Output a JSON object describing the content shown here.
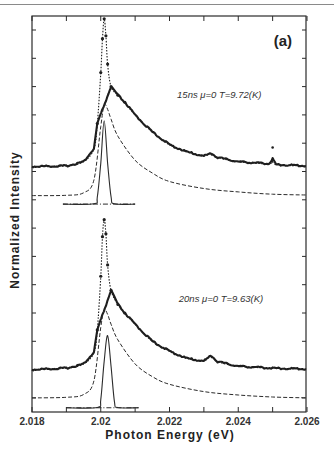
{
  "chart_data": {
    "type": "line",
    "panel_label": "(a)",
    "xlabel": "Photon Energy (eV)",
    "ylabel": "Normalized Intensity",
    "xlim": [
      2.018,
      2.026
    ],
    "x_ticks": [
      2.018,
      2.02,
      2.022,
      2.024,
      2.026
    ],
    "x_tick_labels": [
      "2.018",
      "2.02",
      "2.022",
      "2.024",
      "2.026"
    ],
    "x_minor_ticks": [
      2.019,
      2.021,
      2.023,
      2.025
    ],
    "ylim": [
      0,
      14
    ],
    "y_tick_labels": [],
    "grid": false,
    "legend": null,
    "panels": [
      {
        "annotation": "15ns  μ=0  T=9.72(K)",
        "annotation_pos": [
          2.02222,
          11.1
        ],
        "series": [
          {
            "name": "Measured spectrum (dots)",
            "style": "dotted-markers",
            "baseline": 8.68,
            "points": [
              [
                2.018,
                8.68
              ],
              [
                2.019,
                8.7
              ],
              [
                2.0195,
                8.85
              ],
              [
                2.0198,
                9.3
              ],
              [
                2.0199,
                10.2
              ],
              [
                2.02,
                12.0
              ],
              [
                2.02005,
                13.2
              ],
              [
                2.0201,
                13.9
              ],
              [
                2.02015,
                13.3
              ],
              [
                2.0202,
                12.3
              ],
              [
                2.0203,
                11.5
              ],
              [
                2.0205,
                11.2
              ],
              [
                2.0207,
                10.95
              ],
              [
                2.021,
                10.5
              ],
              [
                2.0215,
                9.9
              ],
              [
                2.022,
                9.45
              ],
              [
                2.0225,
                9.2
              ],
              [
                2.023,
                9.05
              ],
              [
                2.0232,
                9.15
              ],
              [
                2.0234,
                9.0
              ],
              [
                2.024,
                8.85
              ],
              [
                2.0249,
                8.78
              ],
              [
                2.025,
                8.95
              ],
              [
                2.0251,
                8.75
              ],
              [
                2.026,
                8.7
              ]
            ]
          },
          {
            "name": "Fit (dashed)",
            "style": "dashed",
            "baseline": 7.65,
            "points": [
              [
                2.018,
                7.65
              ],
              [
                2.019,
                7.66
              ],
              [
                2.0195,
                7.75
              ],
              [
                2.0198,
                8.2
              ],
              [
                2.02,
                10.1
              ],
              [
                2.0201,
                10.85
              ],
              [
                2.0202,
                10.7
              ],
              [
                2.0203,
                10.35
              ],
              [
                2.0205,
                9.75
              ],
              [
                2.021,
                8.9
              ],
              [
                2.0215,
                8.45
              ],
              [
                2.022,
                8.15
              ],
              [
                2.023,
                7.9
              ],
              [
                2.024,
                7.78
              ],
              [
                2.025,
                7.7
              ],
              [
                2.026,
                7.67
              ]
            ]
          },
          {
            "name": "Instrument response (solid)",
            "style": "solid-with-dashdot-baseline",
            "baseline": 7.35,
            "baseline_range": [
              2.0189,
              2.021
            ],
            "points": [
              [
                2.0189,
                7.35
              ],
              [
                2.0198,
                7.36
              ],
              [
                2.0199,
                7.6
              ],
              [
                2.02,
                8.8
              ],
              [
                2.0201,
                10.3
              ],
              [
                2.0202,
                8.8
              ],
              [
                2.0203,
                7.6
              ],
              [
                2.0204,
                7.36
              ],
              [
                2.021,
                7.35
              ]
            ]
          }
        ]
      },
      {
        "annotation": "20ns  μ=0  T=9.63(K)",
        "annotation_pos": [
          2.02227,
          3.9
        ],
        "series": [
          {
            "name": "Measured spectrum (dots)",
            "style": "dotted-markers",
            "baseline": 1.5,
            "points": [
              [
                2.018,
                1.5
              ],
              [
                2.019,
                1.55
              ],
              [
                2.0195,
                1.7
              ],
              [
                2.0198,
                2.1
              ],
              [
                2.0199,
                2.9
              ],
              [
                2.02,
                4.8
              ],
              [
                2.02005,
                6.2
              ],
              [
                2.0201,
                6.8
              ],
              [
                2.02015,
                6.3
              ],
              [
                2.0202,
                5.2
              ],
              [
                2.0203,
                4.3
              ],
              [
                2.0205,
                3.8
              ],
              [
                2.0207,
                3.5
              ],
              [
                2.021,
                3.1
              ],
              [
                2.0215,
                2.5
              ],
              [
                2.022,
                2.15
              ],
              [
                2.0225,
                1.9
              ],
              [
                2.023,
                1.8
              ],
              [
                2.0232,
                2.0
              ],
              [
                2.0234,
                1.78
              ],
              [
                2.024,
                1.62
              ],
              [
                2.025,
                1.55
              ],
              [
                2.026,
                1.52
              ]
            ]
          },
          {
            "name": "Fit (dashed)",
            "style": "dashed",
            "baseline": 0.5,
            "points": [
              [
                2.018,
                0.5
              ],
              [
                2.019,
                0.52
              ],
              [
                2.0195,
                0.62
              ],
              [
                2.0198,
                1.1
              ],
              [
                2.02,
                3.0
              ],
              [
                2.0201,
                3.6
              ],
              [
                2.0202,
                3.45
              ],
              [
                2.0203,
                3.1
              ],
              [
                2.0205,
                2.55
              ],
              [
                2.021,
                1.7
              ],
              [
                2.0215,
                1.25
              ],
              [
                2.022,
                0.98
              ],
              [
                2.023,
                0.72
              ],
              [
                2.024,
                0.6
              ],
              [
                2.025,
                0.53
              ],
              [
                2.026,
                0.5
              ]
            ]
          },
          {
            "name": "Instrument response (solid)",
            "style": "solid-with-dashdot-baseline",
            "baseline": 0.15,
            "baseline_range": [
              2.019,
              2.0211
            ],
            "points": [
              [
                2.019,
                0.15
              ],
              [
                2.0199,
                0.16
              ],
              [
                2.02,
                0.45
              ],
              [
                2.0201,
                1.8
              ],
              [
                2.0202,
                2.7
              ],
              [
                2.0203,
                1.6
              ],
              [
                2.0204,
                0.35
              ],
              [
                2.0205,
                0.16
              ],
              [
                2.0211,
                0.15
              ]
            ]
          }
        ]
      }
    ],
    "stray_point": [
      2.025,
      9.35
    ]
  },
  "colors": {
    "ink": "#2b2b2b",
    "data": "#1e1e1e",
    "rule": "#8a8a8a"
  }
}
